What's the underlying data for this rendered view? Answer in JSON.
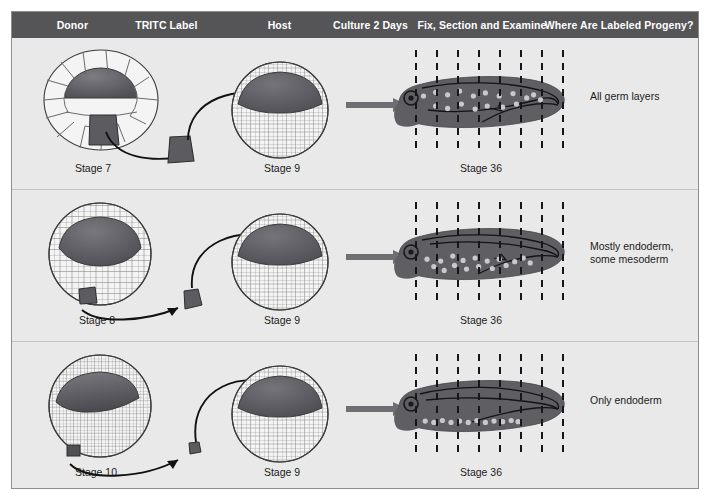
{
  "figure": {
    "background_color": "#e9e9e9",
    "header_color": "#555557",
    "embryo_dark_color": "#5b5b60",
    "tadpole_color": "#5e5e63",
    "arrow_color": "#6f6f73"
  },
  "header": {
    "columns": [
      {
        "label": "Donor",
        "center_pct": 8.8
      },
      {
        "label": "TRITC Label",
        "center_pct": 22.5
      },
      {
        "label": "Host",
        "center_pct": 38.9
      },
      {
        "label": "Culture 2 Days",
        "center_pct": 52.3
      },
      {
        "label": "Fix, Section and Examine",
        "center_pct": 68.6
      },
      {
        "label": "Where Are Labeled Progeny?",
        "center_pct": 88.5
      }
    ]
  },
  "rows": [
    {
      "id": "row-stage-7",
      "donor_stage": "Stage 7",
      "donor_type": "large-blastomeres",
      "host_stage": "Stage 9",
      "larva_stage": "Stage 36",
      "result": "All germ layers",
      "label_piece_size": "large",
      "section_lines": 8,
      "labeled_cells": [
        [
          0.16,
          0.42
        ],
        [
          0.23,
          0.36
        ],
        [
          0.23,
          0.58
        ],
        [
          0.3,
          0.4
        ],
        [
          0.3,
          0.62
        ],
        [
          0.37,
          0.34
        ],
        [
          0.38,
          0.55
        ],
        [
          0.45,
          0.42
        ],
        [
          0.46,
          0.63
        ],
        [
          0.52,
          0.37
        ],
        [
          0.53,
          0.58
        ],
        [
          0.6,
          0.42
        ],
        [
          0.62,
          0.6
        ],
        [
          0.68,
          0.38
        ],
        [
          0.7,
          0.55
        ],
        [
          0.76,
          0.45
        ],
        [
          0.8,
          0.4
        ],
        [
          0.84,
          0.48
        ]
      ]
    },
    {
      "id": "row-stage-8",
      "donor_stage": "Stage 8",
      "donor_type": "medium-blastomeres",
      "host_stage": "Stage 9",
      "larva_stage": "Stage 36",
      "result": "Mostly endoderm,\nsome mesoderm",
      "label_piece_size": "medium",
      "section_lines": 8,
      "labeled_cells": [
        [
          0.18,
          0.6
        ],
        [
          0.22,
          0.72
        ],
        [
          0.26,
          0.63
        ],
        [
          0.28,
          0.78
        ],
        [
          0.33,
          0.55
        ],
        [
          0.34,
          0.7
        ],
        [
          0.39,
          0.62
        ],
        [
          0.41,
          0.76
        ],
        [
          0.46,
          0.58
        ],
        [
          0.48,
          0.72
        ],
        [
          0.53,
          0.63
        ],
        [
          0.56,
          0.75
        ],
        [
          0.6,
          0.6
        ],
        [
          0.64,
          0.7
        ],
        [
          0.69,
          0.64
        ],
        [
          0.74,
          0.58
        ],
        [
          0.78,
          0.66
        ]
      ]
    },
    {
      "id": "row-stage-10",
      "donor_stage": "Stage 10",
      "donor_type": "small-blastomeres",
      "host_stage": "Stage 9",
      "larva_stage": "Stage 36",
      "result": "Only endoderm",
      "label_piece_size": "small",
      "section_lines": 8,
      "labeled_cells": [
        [
          0.17,
          0.76
        ],
        [
          0.22,
          0.78
        ],
        [
          0.27,
          0.75
        ],
        [
          0.32,
          0.78
        ],
        [
          0.37,
          0.76
        ],
        [
          0.42,
          0.78
        ],
        [
          0.47,
          0.75
        ],
        [
          0.52,
          0.78
        ],
        [
          0.57,
          0.76
        ],
        [
          0.62,
          0.77
        ],
        [
          0.67,
          0.75
        ],
        [
          0.71,
          0.77
        ]
      ]
    }
  ]
}
